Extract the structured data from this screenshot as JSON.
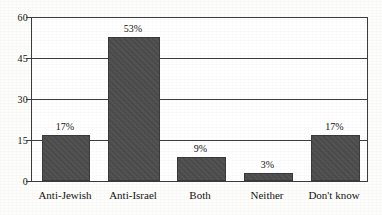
{
  "chart_data": {
    "type": "bar",
    "title": "",
    "subtitle": "",
    "xlabel": "",
    "ylabel": "",
    "categories": [
      "Anti-Jewish",
      "Anti-Israel",
      "Both",
      "Neither",
      "Don't know"
    ],
    "values": [
      17,
      53,
      9,
      3,
      17
    ],
    "value_labels": [
      "17%",
      "53%",
      "9%",
      "3%",
      "17%"
    ],
    "ylim": [
      0,
      60
    ],
    "yticks": [
      0,
      15,
      30,
      45,
      60
    ],
    "ytick_labels": [
      "0",
      "15",
      "30",
      "45",
      "60"
    ],
    "grid": "horizontal",
    "legend": "none",
    "series": [
      {
        "name": "Share of respondents",
        "values": [
          17,
          53,
          9,
          3,
          17
        ]
      }
    ],
    "colors": {
      "bar_fill": "#4d4d4d",
      "bar_edge": "#3a3a3a",
      "axis": "#3c3c3c",
      "text": "#15140f",
      "background": "#ffffff"
    }
  }
}
